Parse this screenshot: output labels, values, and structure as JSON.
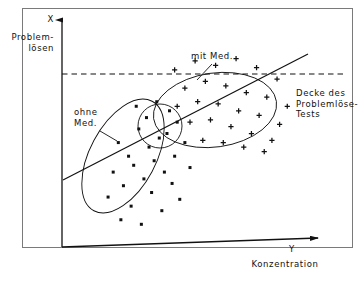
{
  "figure": {
    "type": "scatter",
    "axes": {
      "y_axis": {
        "symbol": "X",
        "label": "Problem-\nlösen",
        "direction": "up"
      },
      "x_axis": {
        "symbol": "Y",
        "label": "Konzentration",
        "direction": "right"
      }
    },
    "annotations": {
      "ceiling": "Decke des\nProblemlöse-\nTests",
      "group_with_med": "mit Med.",
      "group_without_med": "ohne\nMed."
    },
    "colors": {
      "ink": "#111111",
      "frame": "#555555",
      "background": "#ffffff"
    }
  },
  "chart_data": {
    "type": "scatter",
    "title": "",
    "xlabel": "Konzentration",
    "ylabel": "Problemlösen",
    "xlim": [
      0,
      100
    ],
    "ylim": [
      0,
      100
    ],
    "grid": false,
    "legend": "inline-annotations",
    "series": [
      {
        "name": "ohne Med.",
        "marker": "dot",
        "points": [
          [
            22,
            46
          ],
          [
            30,
            52
          ],
          [
            26,
            40
          ],
          [
            34,
            44
          ],
          [
            20,
            33
          ],
          [
            28,
            36
          ],
          [
            36,
            38
          ],
          [
            24,
            27
          ],
          [
            32,
            30
          ],
          [
            40,
            33
          ],
          [
            18,
            22
          ],
          [
            27,
            18
          ],
          [
            35,
            24
          ],
          [
            43,
            28
          ],
          [
            23,
            12
          ],
          [
            31,
            10
          ],
          [
            39,
            16
          ],
          [
            46,
            21
          ],
          [
            38,
            48
          ],
          [
            44,
            40
          ],
          [
            33,
            57
          ],
          [
            41,
            50
          ],
          [
            29,
            62
          ],
          [
            37,
            64
          ],
          [
            45,
            55
          ],
          [
            48,
            46
          ],
          [
            50,
            35
          ],
          [
            42,
            60
          ]
        ]
      },
      {
        "name": "mit Med.",
        "marker": "plus",
        "points": [
          [
            44,
            78
          ],
          [
            52,
            82
          ],
          [
            60,
            80
          ],
          [
            68,
            83
          ],
          [
            76,
            79
          ],
          [
            84,
            74
          ],
          [
            48,
            70
          ],
          [
            56,
            73
          ],
          [
            64,
            71
          ],
          [
            72,
            68
          ],
          [
            80,
            66
          ],
          [
            88,
            62
          ],
          [
            45,
            62
          ],
          [
            53,
            64
          ],
          [
            61,
            63
          ],
          [
            69,
            60
          ],
          [
            77,
            58
          ],
          [
            85,
            54
          ],
          [
            50,
            55
          ],
          [
            58,
            56
          ],
          [
            66,
            53
          ],
          [
            74,
            50
          ],
          [
            82,
            47
          ],
          [
            55,
            47
          ],
          [
            63,
            46
          ],
          [
            71,
            44
          ],
          [
            79,
            42
          ]
        ]
      }
    ],
    "shapes": [
      {
        "name": "ellipse-ohne-med",
        "type": "ellipse",
        "cx": 34,
        "cy": 38,
        "rx": 30,
        "ry": 14,
        "rotation": -62
      },
      {
        "name": "ellipse-mit-med",
        "type": "ellipse",
        "cx": 66,
        "cy": 63,
        "rx": 28,
        "ry": 16,
        "rotation": -8
      },
      {
        "name": "circle-overlap",
        "type": "circle",
        "cx": 44,
        "cy": 56,
        "rx": 10,
        "ry": 10,
        "rotation": 0
      }
    ],
    "lines": [
      {
        "name": "trend-line",
        "style": "solid",
        "x": [
          1,
          95
        ],
        "y": [
          28,
          82
        ]
      },
      {
        "name": "ceiling-line",
        "style": "dashed",
        "x": [
          0,
          100
        ],
        "y": [
          75,
          75
        ]
      }
    ]
  }
}
